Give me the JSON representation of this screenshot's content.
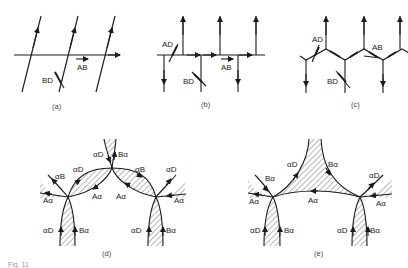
{
  "panels": {
    "a": {
      "caption": "(a)",
      "labels": {
        "ab": "AB",
        "bd": "BD"
      }
    },
    "b": {
      "caption": "(b)",
      "labels": {
        "ad": "AD",
        "ab": "AB",
        "bd": "BD"
      }
    },
    "c": {
      "caption": "(c)",
      "labels": {
        "ad": "AD",
        "ab": "AB",
        "bd": "BD"
      }
    },
    "d": {
      "caption": "(d)",
      "labels": {
        "top_ad": "αD",
        "top_ba": "Bα",
        "left_ab": "αB",
        "left_ad": "αD",
        "left_aa": "Aα",
        "left_aa2": "Aα",
        "right_ab": "αB",
        "right_ad": "αD",
        "right_aa": "Aα",
        "right_aa2": "Aα",
        "bl_ad": "αD",
        "bl_ba": "Bα",
        "br_ad": "αD",
        "br_ba": "Bα"
      }
    },
    "e": {
      "caption": "(e)",
      "labels": {
        "ad_left": "αD",
        "ba_right": "Bα",
        "left_ba": "Bα",
        "left_aa": "Aα",
        "mid_aa": "Aα",
        "right_ad": "αD",
        "right_aa": "Aα",
        "bl_ad": "αD",
        "bl_ba": "Bα",
        "br_ad": "αD",
        "br_ba": "Bα"
      }
    }
  },
  "figure_caption": "Fig. 11"
}
